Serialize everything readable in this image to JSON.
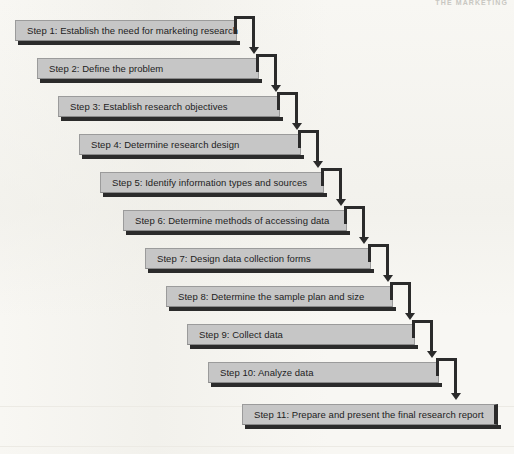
{
  "page": {
    "running_head": "THE MARKETING",
    "background_color": "#f8f7f3",
    "width": 514,
    "height": 454
  },
  "diagram": {
    "type": "staircase-flowchart",
    "box_fill_color": "#c6c6c6",
    "box_border_color": "#9b9b9b",
    "shadow_color": "#2b2b2b",
    "connector_color": "#2b2b2b",
    "text_color": "#1d1d1d",
    "step_x_offset": 20,
    "step_y_offset": 38,
    "steps": [
      {
        "number": 1,
        "label": "Step 1: Establish the need for marketing research",
        "x": 15,
        "y": 20,
        "width": 222,
        "has_connector": true
      },
      {
        "number": 2,
        "label": "Step 2: Define the problem",
        "x": 37,
        "y": 58,
        "width": 222,
        "has_connector": true
      },
      {
        "number": 3,
        "label": "Step 3: Establish research objectives",
        "x": 58,
        "y": 96,
        "width": 222,
        "has_connector": true
      },
      {
        "number": 4,
        "label": "Step 4: Determine research design",
        "x": 79,
        "y": 134,
        "width": 222,
        "has_connector": true
      },
      {
        "number": 5,
        "label": "Step 5: Identify information types and sources",
        "x": 100,
        "y": 172,
        "width": 224,
        "has_connector": true
      },
      {
        "number": 6,
        "label": "Step 6: Determine methods of accessing data",
        "x": 123,
        "y": 210,
        "width": 224,
        "has_connector": true
      },
      {
        "number": 7,
        "label": "Step 7: Design data collection forms",
        "x": 145,
        "y": 248,
        "width": 226,
        "has_connector": true
      },
      {
        "number": 8,
        "label": "Step 8: Determine the sample plan and size",
        "x": 166,
        "y": 286,
        "width": 227,
        "has_connector": true
      },
      {
        "number": 9,
        "label": "Step 9: Collect data",
        "x": 187,
        "y": 324,
        "width": 228,
        "has_connector": true
      },
      {
        "number": 10,
        "label": "Step 10: Analyze data",
        "x": 208,
        "y": 362,
        "width": 231,
        "has_connector": true
      },
      {
        "number": 11,
        "label": "Step 11: Prepare and present the final research report",
        "x": 242,
        "y": 404,
        "width": 256,
        "has_connector": false
      }
    ]
  }
}
